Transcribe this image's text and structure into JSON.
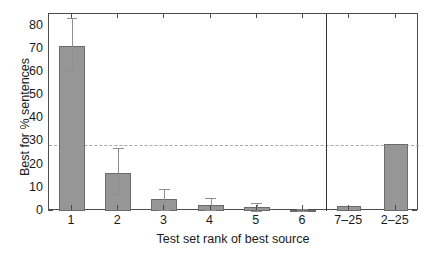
{
  "chart_data": {
    "type": "bar",
    "title": "",
    "xlabel": "Test set rank of best source",
    "ylabel": "Best for % sentences",
    "categories": [
      "1",
      "2",
      "3",
      "4",
      "5",
      "6",
      "7–25",
      "2–25"
    ],
    "values": [
      71.2,
      16.2,
      5.0,
      2.8,
      1.7,
      0.4,
      2.2,
      29.0
    ],
    "errors_low": [
      60.2,
      7.2,
      0.6,
      0.3,
      0.2,
      0.0,
      null,
      null
    ],
    "errors_high": [
      83.2,
      27.0,
      9.6,
      5.6,
      3.4,
      1.0,
      null,
      null
    ],
    "ylim": [
      0,
      85
    ],
    "yticks": [
      0,
      10,
      20,
      30,
      40,
      50,
      60,
      70,
      80
    ],
    "ytick_labels": [
      "0",
      "10",
      "20",
      "30",
      "40",
      "50",
      "60",
      "70",
      "80"
    ],
    "reference_line": 28.5,
    "reference_line_style": "dashed",
    "panel_divider_after_category": "6",
    "grid": false,
    "legend": null,
    "bar_color": "#969696",
    "bar_edge_color": "#6b6b6b",
    "error_bar_color": "#8f8f8f",
    "reference_line_color": "#a9a9a9",
    "axis_color": "#4d4d4d",
    "divider_color": "#333333",
    "background_color": "#ffffff"
  }
}
